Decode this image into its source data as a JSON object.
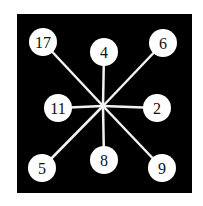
{
  "diagram": {
    "background": "#000000",
    "line_color": "#f2f2f2",
    "node_fill": "#ffffff",
    "text_color": "#111111",
    "center": {
      "x": 103,
      "y": 106
    },
    "nodes": [
      {
        "label": "17",
        "x": 43,
        "y": 42
      },
      {
        "label": "4",
        "x": 104,
        "y": 52
      },
      {
        "label": "6",
        "x": 163,
        "y": 43
      },
      {
        "label": "11",
        "x": 58,
        "y": 108
      },
      {
        "label": "2",
        "x": 157,
        "y": 108
      },
      {
        "label": "5",
        "x": 42,
        "y": 168
      },
      {
        "label": "8",
        "x": 104,
        "y": 160
      },
      {
        "label": "9",
        "x": 162,
        "y": 168
      }
    ]
  }
}
